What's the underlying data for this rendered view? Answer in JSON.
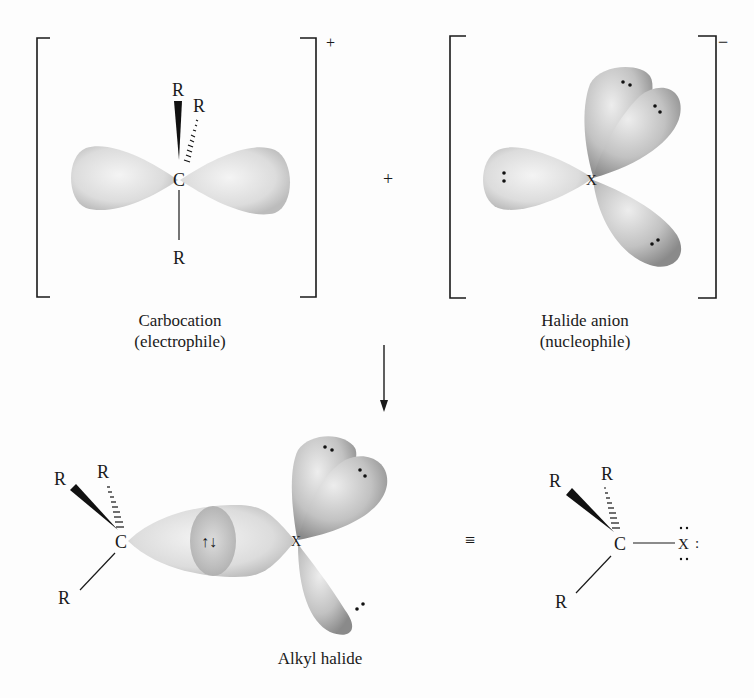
{
  "figure": {
    "reactants": {
      "carbocation": {
        "charge": "+",
        "center_atom": "C",
        "substituents": [
          "R",
          "R",
          "R"
        ],
        "caption_line1": "Carbocation",
        "caption_line2": "(electrophile)"
      },
      "plus_sign": "+",
      "halide": {
        "charge": "−",
        "center_atom": "X",
        "lone_pair": ":",
        "caption_line1": "Halide anion",
        "caption_line2": "(nucleophile)"
      }
    },
    "arrow": "reaction-arrow-down",
    "product": {
      "center_atom": "C",
      "halogen": "X",
      "substituents": [
        "R",
        "R",
        "R"
      ],
      "bond_electrons": "↑↓",
      "equivalence_symbol": "≡",
      "lewis_lone_pair": ":",
      "caption": "Alkyl halide"
    },
    "colors": {
      "ink": "#1a1a1a",
      "orbital_light": "#f2f2f2",
      "orbital_mid": "#c8c8c8",
      "orbital_dark": "#8e8e8e",
      "background": "#fdfdfd"
    }
  }
}
